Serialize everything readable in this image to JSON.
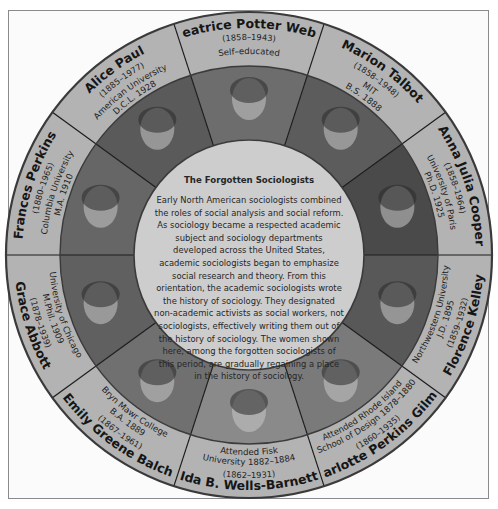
{
  "figure": {
    "title": "The Forgotten Sociologists",
    "body": "Early North American sociologists combined the roles of social analysis and social reform. As sociology became a respected academic subject and sociology departments developed across the United States, academic sociologists began to emphasize social research and theory. From this orientation, the academic sociologists wrote the history of sociology. They designated non-academic activists as social workers, not sociologists, effectively writing them out of the history of sociology. The women shown here, among the forgotten sociologists of this period, are gradually regaining a place in the history of sociology.",
    "colors": {
      "band": "#b3b3b3",
      "center": "#cdcdcd",
      "outline": "#3a3a3a",
      "divider": "#1c1c1c"
    },
    "sociologists": [
      {
        "name": "Beatrice Potter Webb",
        "years": "(1858–1943)",
        "education": [
          "Self–educated"
        ],
        "position": "top"
      },
      {
        "name": "Marion Talbot",
        "years": "(1858–1948)",
        "education": [
          "MIT",
          "B.S. 1888"
        ],
        "position": "top-right"
      },
      {
        "name": "Anna Julia Cooper",
        "years": "(1858–1964)",
        "education": [
          "University of Paris",
          "Ph.D. 1925"
        ],
        "position": "right-upper"
      },
      {
        "name": "Florence Kelley",
        "years": "(1859–1932)",
        "education": [
          "Northwestern University",
          "J.D. 1895"
        ],
        "position": "right-lower"
      },
      {
        "name": "Charlotte Perkins Gilman",
        "years": "(1860–1935)",
        "education": [
          "Attended Rhode Island",
          "School of Design 1878–1880"
        ],
        "position": "bottom-right"
      },
      {
        "name": "Ida B. Wells-Barnett",
        "years": "(1862–1931)",
        "education": [
          "Attended Fisk",
          "University 1882–1884"
        ],
        "position": "bottom"
      },
      {
        "name": "Emily Greene Balch",
        "years": "(1867–1961)",
        "education": [
          "Bryn Mawr College",
          "B.A. 1889"
        ],
        "position": "bottom-left"
      },
      {
        "name": "Grace Abbott",
        "years": "(1878–1939)",
        "education": [
          "University of Chicago",
          "M.Phil. 1909"
        ],
        "position": "left-lower"
      },
      {
        "name": "Frances Perkins",
        "years": "(1880–1965)",
        "education": [
          "Columbia University",
          "M.A. 1910"
        ],
        "position": "left-upper"
      },
      {
        "name": "Alice Paul",
        "years": "(1885–1977)",
        "education": [
          "American University",
          "D.C.L. 1928"
        ],
        "position": "top-left"
      }
    ]
  }
}
